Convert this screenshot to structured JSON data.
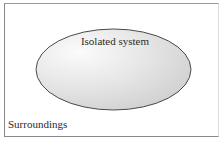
{
  "diagram": {
    "type": "system-boundary",
    "system": {
      "label": "Isolated system",
      "shape": "ellipse",
      "fill_highlight": "#fbfbfb",
      "fill_edge": "#cdcdcd",
      "outline": "#4a4a4a"
    },
    "surroundings": {
      "label": "Surroundings",
      "frame_color": "#8a8a8a"
    }
  }
}
